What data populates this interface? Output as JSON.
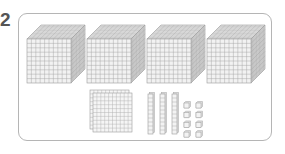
{
  "question": {
    "number": "2"
  },
  "base_ten_blocks": {
    "thousands_cubes": 4,
    "hundreds_flats": 2,
    "tens_rods": 3,
    "ones_units": 8
  },
  "colors": {
    "grid_line": "#9a9a9a",
    "face_front": "#f2f2f2",
    "face_top": "#e6e6e6",
    "face_side": "#d6d6d6",
    "frame_border": "#b5b5b5",
    "number_text": "#555555"
  }
}
